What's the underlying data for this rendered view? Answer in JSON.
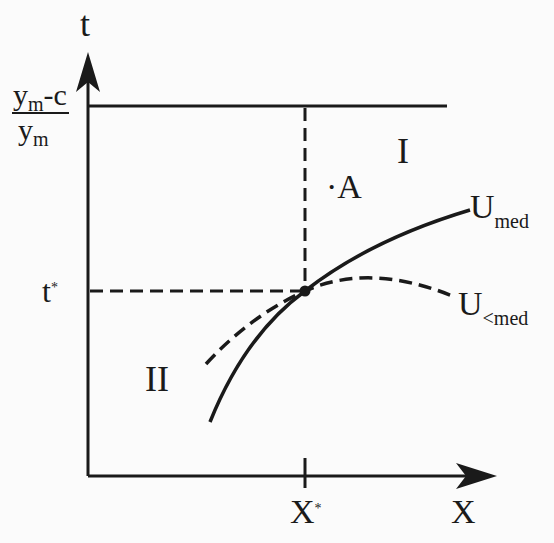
{
  "diagram": {
    "axes": {
      "y_label": "t",
      "x_label": "X"
    },
    "y_ticks": {
      "top_fraction": {
        "numerator_main": "y",
        "numerator_sub": "m",
        "numerator_rest": "-c",
        "denominator_main": "y",
        "denominator_sub": "m"
      },
      "t_star": {
        "main": "t",
        "sup": "*"
      }
    },
    "x_ticks": {
      "x_star": {
        "main": "X",
        "sup": "*"
      }
    },
    "regions": {
      "region_1": "I",
      "region_2": "II"
    },
    "point": {
      "label": "A",
      "dot": "·"
    },
    "curves": {
      "solid": {
        "main": "U",
        "sub": "med"
      },
      "dashed": {
        "main": "U",
        "sub": "<med"
      }
    },
    "colors": {
      "ink": "#1a1a1a",
      "background": "#fbfbfb"
    }
  }
}
